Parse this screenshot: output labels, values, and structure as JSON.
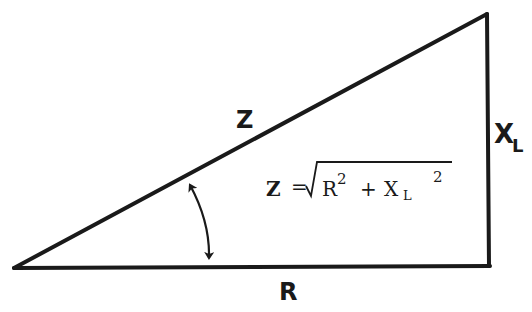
{
  "diagram": {
    "colors": {
      "stroke": "#1a1a1a",
      "background": "#ffffff"
    },
    "vertices": {
      "origin": [
        14,
        268
      ],
      "right_angle": [
        490,
        266
      ],
      "top": [
        487,
        14
      ]
    },
    "labels": {
      "hypotenuse": "Z",
      "base": "R",
      "vertical_main": "X",
      "vertical_sub": "L"
    },
    "formula": {
      "lhs": "Z",
      "equals": "=",
      "sqrt": "√",
      "term1_base": "R",
      "term1_exp": "2",
      "plus": "+",
      "term2_base": "X",
      "term2_sub": "L",
      "term2_exp": "2"
    },
    "angle_marker": "phase-angle-arc"
  }
}
